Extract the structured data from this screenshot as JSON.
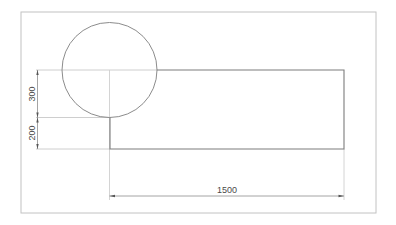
{
  "drawing": {
    "frame": {
      "x": 21,
      "y": 12,
      "width": 355,
      "height": 201,
      "color": "#bdbdbd"
    },
    "circle": {
      "cx": 109.5,
      "cy": 70,
      "r": 47.5,
      "color": "#8a8a8a"
    },
    "rectangle": {
      "x": 110,
      "y": 70,
      "width": 234,
      "height": 79,
      "color": "#7a7a7a"
    },
    "dimensions": {
      "vertical_upper": {
        "label": "300"
      },
      "vertical_lower": {
        "label": "200"
      },
      "horizontal": {
        "label": "1500"
      }
    },
    "colors": {
      "construction_line": "#c4c4c4",
      "dimension_line": "#9a9a9a",
      "text": "#4a4a4a"
    }
  }
}
